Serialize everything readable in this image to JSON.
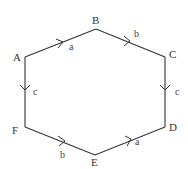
{
  "diagram": {
    "type": "directed-hexagon",
    "vertices": [
      {
        "id": "A",
        "label": "A",
        "x": 25,
        "y": 57,
        "lx": 13,
        "ly": 61
      },
      {
        "id": "B",
        "label": "B",
        "x": 96,
        "y": 29,
        "lx": 92,
        "ly": 24
      },
      {
        "id": "C",
        "label": "C",
        "x": 165,
        "y": 57,
        "lx": 169,
        "ly": 58
      },
      {
        "id": "D",
        "label": "D",
        "x": 165,
        "y": 127,
        "lx": 169,
        "ly": 131
      },
      {
        "id": "E",
        "label": "E",
        "x": 95,
        "y": 155,
        "lx": 91,
        "ly": 166
      },
      {
        "id": "F",
        "label": "F",
        "x": 25,
        "y": 127,
        "lx": 12,
        "ly": 134
      }
    ],
    "edges": [
      {
        "from": "A",
        "to": "B",
        "label": "a",
        "lx": 69,
        "ly": 50
      },
      {
        "from": "B",
        "to": "C",
        "label": "b",
        "lx": 134,
        "ly": 37
      },
      {
        "from": "A",
        "to": "F",
        "label": "c",
        "lx": 33,
        "ly": 95
      },
      {
        "from": "C",
        "to": "D",
        "label": "c",
        "lx": 175,
        "ly": 95
      },
      {
        "from": "F",
        "to": "E",
        "label": "b",
        "lx": 60,
        "ly": 158
      },
      {
        "from": "E",
        "to": "D",
        "label": "a",
        "lx": 135,
        "ly": 145
      }
    ]
  }
}
